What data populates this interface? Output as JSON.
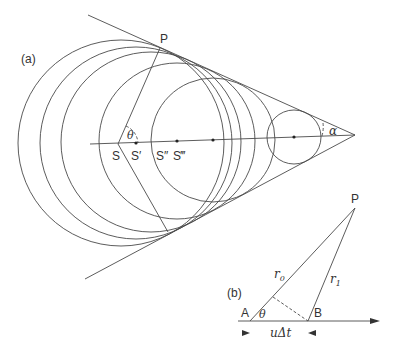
{
  "panel_a": {
    "label": "(a)",
    "point_P": "P",
    "angle_theta": "θ",
    "angle_alpha": "α",
    "sources": [
      "S",
      "S′",
      "S″",
      "S‴"
    ],
    "apex": [
      355,
      135
    ],
    "axis": {
      "from": [
        90,
        144
      ],
      "to": [
        355,
        135
      ]
    },
    "tangent_upper": {
      "from": [
        88,
        15
      ],
      "to": [
        355,
        135
      ]
    },
    "tangent_lower": {
      "from": [
        85,
        279
      ],
      "to": [
        355,
        135
      ]
    },
    "circles": [
      {
        "cx": 121,
        "cy": 143,
        "r": 103
      },
      {
        "cx": 136,
        "cy": 143,
        "r": 96
      },
      {
        "cx": 151,
        "cy": 142,
        "r": 90
      },
      {
        "cx": 177,
        "cy": 141,
        "r": 78
      },
      {
        "cx": 213,
        "cy": 140,
        "r": 62
      },
      {
        "cx": 294,
        "cy": 137,
        "r": 27
      }
    ],
    "dots": [
      [
        136,
        143
      ],
      [
        177,
        141
      ],
      [
        213,
        140
      ],
      [
        294,
        137
      ]
    ],
    "P_point": [
      160,
      48
    ],
    "S_point": [
      118,
      144
    ],
    "lower_ray_end": [
      168,
      232
    ]
  },
  "panel_b": {
    "label": "(b)",
    "point_P": "P",
    "point_A": "A",
    "point_B": "B",
    "angle_theta": "θ",
    "r0": {
      "base": "r",
      "sub": "0"
    },
    "r1": {
      "base": "r",
      "sub": "1"
    },
    "distance_label": "uΔt",
    "A": [
      250,
      321
    ],
    "B": [
      308,
      321
    ],
    "P": [
      355,
      208
    ],
    "arrow_end": [
      380,
      321
    ],
    "perp_foot": [
      273,
      297
    ]
  }
}
